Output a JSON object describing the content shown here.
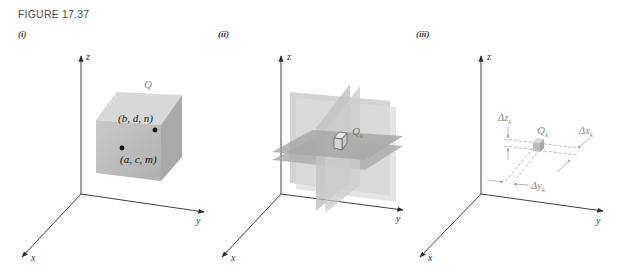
{
  "figure": {
    "title": "FIGURE 17.37",
    "panels": [
      {
        "label": "(i)",
        "axes": {
          "z": "z",
          "y": "y",
          "x": "x"
        },
        "solid_label": "Q",
        "points": [
          {
            "label": "(b, d, n)"
          },
          {
            "label": "(a, c, m)"
          }
        ]
      },
      {
        "label": "(ii)",
        "axes": {
          "z": "z",
          "y": "y",
          "x": "x"
        },
        "subbox_label": "Q",
        "subbox_subscript": "k"
      },
      {
        "label": "(iii)",
        "axes": {
          "z": "z",
          "y": "y",
          "x": "x"
        },
        "subbox_label": "Q",
        "subbox_subscript": "k",
        "dimensions": [
          {
            "name": "Δz",
            "subscript": "k"
          },
          {
            "name": "Δx",
            "subscript": "k"
          },
          {
            "name": "Δy",
            "subscript": "k"
          }
        ]
      }
    ]
  },
  "colors": {
    "axis": "#2a2a2a",
    "box_front": "#b9b9b9",
    "box_top": "#d6d6d6",
    "box_side": "#a7a7a7",
    "label_gray": "#8a8a8a"
  }
}
